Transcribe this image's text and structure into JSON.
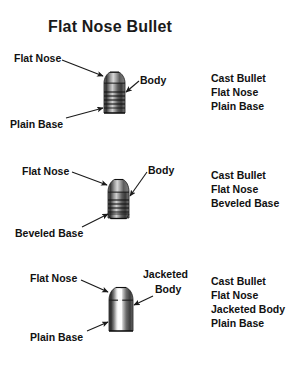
{
  "page": {
    "title": "Flat Nose Bullet",
    "background_color": "#ffffff",
    "text_color": "#111111"
  },
  "sections": [
    {
      "id": "cast-plain-base",
      "bullet_type": "cast-flat-nose-plain-base",
      "callouts": {
        "nose": "Flat Nose",
        "body": "Body",
        "base": "Plain Base"
      },
      "legend": [
        "Cast Bullet",
        "Flat Nose",
        "Plain Base"
      ]
    },
    {
      "id": "cast-beveled-base",
      "bullet_type": "cast-flat-nose-beveled-base",
      "callouts": {
        "nose": "Flat Nose",
        "body": "Body",
        "base": "Beveled Base"
      },
      "legend": [
        "Cast Bullet",
        "Flat Nose",
        "Beveled Base"
      ]
    },
    {
      "id": "jacketed-plain-base",
      "bullet_type": "jacketed-flat-nose-plain-base",
      "callouts": {
        "nose": "Flat Nose",
        "body_line1": "Jacketed",
        "body_line2": "Body",
        "base": "Plain Base"
      },
      "legend": [
        "Cast Bullet",
        "Flat Nose",
        "Jacketed Body",
        "Plain Base"
      ]
    }
  ]
}
